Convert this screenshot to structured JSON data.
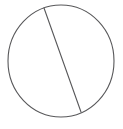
{
  "figure": {
    "title": "Circle divided by a chord",
    "background_color": "#ffffff",
    "stroke_color": "#58585a",
    "fill_color": "none",
    "stroke_width": 1.1,
    "canvas": {
      "width": 123,
      "height": 129
    }
  },
  "chart_data": {
    "type": "diagram",
    "title": "Circle divided by a chord",
    "subtitle": "",
    "xlabel": "",
    "ylabel": "",
    "grid": false,
    "legend": "none",
    "xlim": [
      0,
      123
    ],
    "ylim": [
      0,
      129
    ],
    "shapes": [
      {
        "name": "circle",
        "kind": "ellipse",
        "cx": 61,
        "cy": 61,
        "rx": 53,
        "ry": 56,
        "stroke": "#58585a",
        "fill": "none"
      },
      {
        "name": "chord",
        "kind": "line",
        "x1": 44,
        "y1": 8,
        "x2": 81,
        "y2": 112,
        "stroke": "#58585a"
      }
    ],
    "regions": [
      {
        "name": "left-segment",
        "label": ""
      },
      {
        "name": "right-segment",
        "label": ""
      }
    ],
    "annotations": []
  }
}
